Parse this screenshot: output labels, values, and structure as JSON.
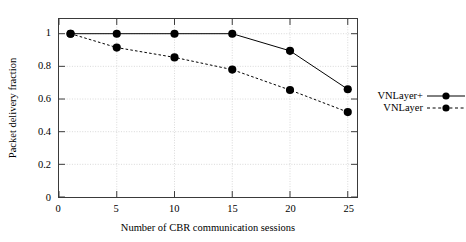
{
  "chart_data": {
    "type": "line",
    "title": "",
    "xlabel": "Number of CBR communication sessions",
    "ylabel": "Packet delivery fraction",
    "xlim": [
      0,
      25.8
    ],
    "ylim": [
      0,
      1.09
    ],
    "xticks": [
      0,
      5,
      10,
      15,
      20,
      25
    ],
    "xtick_labels": [
      "0",
      "5",
      "10",
      "15",
      "20",
      "25"
    ],
    "yticks": [
      0,
      0.2,
      0.4,
      0.6,
      0.8,
      1
    ],
    "ytick_labels": [
      "0",
      "0.2",
      "0.4",
      "0.6",
      "0.8",
      "1"
    ],
    "grid": true,
    "legend_position": "right-outside",
    "x": [
      1,
      5,
      10,
      15,
      20,
      25
    ],
    "series": [
      {
        "name": "VNLayer+",
        "values": [
          1.0,
          1.0,
          1.0,
          1.0,
          0.895,
          0.66
        ],
        "line_style": "solid",
        "marker": "filled-circle",
        "color": "#000000"
      },
      {
        "name": "VNLayer",
        "values": [
          1.0,
          0.915,
          0.855,
          0.78,
          0.655,
          0.52
        ],
        "line_style": "dashed",
        "marker": "filled-circle",
        "color": "#000000"
      }
    ]
  },
  "colors": {
    "frame": "#3a3a3a",
    "grid": "#c8c8c8",
    "ink": "#000000",
    "background": "#ffffff"
  }
}
